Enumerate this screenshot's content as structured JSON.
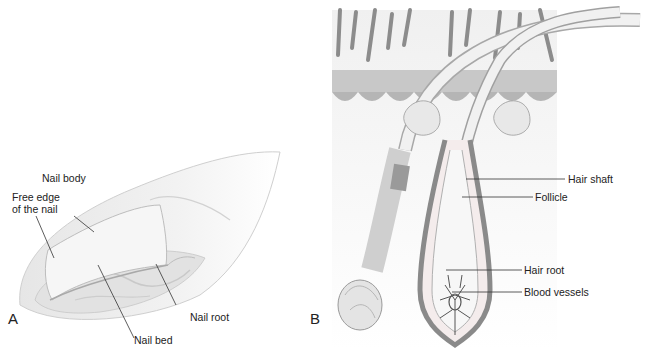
{
  "figure": {
    "panels": [
      {
        "id": "A",
        "letter": "A",
        "subject": "fingernail",
        "labels": {
          "nail_body": "Nail body",
          "free_edge_line1": "Free  edge",
          "free_edge_line2": "of the nail",
          "nail_root": "Nail root",
          "nail_bed": "Nail bed"
        }
      },
      {
        "id": "B",
        "letter": "B",
        "subject": "hair follicle",
        "labels": {
          "hair_shaft": "Hair shaft",
          "follicle": "Follicle",
          "hair_root": "Hair root",
          "blood_vessels": "Blood vessels"
        }
      }
    ],
    "colors": {
      "line": "#333333",
      "skin_gray": "#b8b8b8",
      "follicle_dark": "#8a8a8a",
      "hair_light": "#eeeeee"
    }
  }
}
